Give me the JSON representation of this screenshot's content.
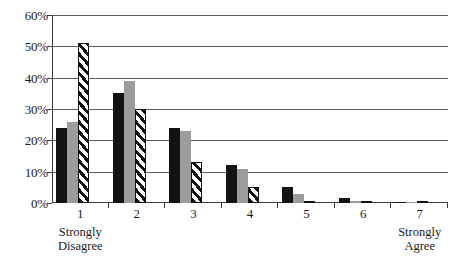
{
  "chart_data": {
    "type": "bar",
    "title": "",
    "xlabel": "",
    "ylabel": "",
    "categories": [
      "1",
      "2",
      "3",
      "4",
      "5",
      "6",
      "7"
    ],
    "category_anchors": {
      "1": "Strongly Disagree",
      "7": "Strongly Agree"
    },
    "anchor_low_line1": "Strongly",
    "anchor_low_line2": "Disagree",
    "anchor_high_line1": "Strongly",
    "anchor_high_line2": "Agree",
    "series": [
      {
        "name": "series-1-black",
        "style": "solid-black",
        "color": "#131313",
        "values": [
          24,
          35,
          24,
          12,
          5,
          1.5,
          0.3
        ]
      },
      {
        "name": "series-2-gray",
        "style": "solid-gray",
        "color": "#9c9c9c",
        "values": [
          26,
          39,
          23,
          11,
          3,
          0.6,
          0.3
        ]
      },
      {
        "name": "series-3-hatched",
        "style": "diagonal-hatch",
        "color": "#111111",
        "values": [
          51,
          30,
          13,
          5,
          0.2,
          0.4,
          0.2
        ]
      }
    ],
    "ylim": [
      0,
      60
    ],
    "yticks": [
      0,
      10,
      20,
      30,
      40,
      50,
      60
    ],
    "ytick_labels": [
      "0%",
      "10%",
      "20%",
      "30%",
      "40%",
      "50%",
      "60%"
    ],
    "grid": true,
    "grid_axis": "y",
    "legend": "none",
    "legend_position": "none",
    "axis_color": "#3a3a3a",
    "grid_color": "#5e5e5e",
    "background": "#ffffff"
  }
}
